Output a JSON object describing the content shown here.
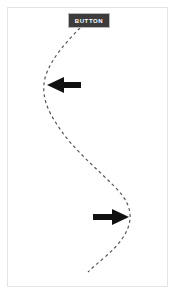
{
  "canvas": {
    "width": 176,
    "height": 295,
    "background_color": "#ffffff"
  },
  "frame": {
    "name": "page-border",
    "border_color": "#e3e3e3",
    "x": 7,
    "y": 7,
    "width": 161,
    "height": 280
  },
  "button": {
    "label": "BUTTON",
    "text_color": "#ffffff",
    "fill_color": "#3c3c3c",
    "border_color": "#b9b9b9",
    "x": 68,
    "y": 13,
    "width": 42,
    "height": 15
  },
  "curve": {
    "name": "dashed-swoosh-path",
    "color": "#555555",
    "stroke_width": 1.2,
    "dash_pattern": "3 3",
    "style": "dashed",
    "points": [
      [
        80,
        28
      ],
      [
        58,
        52
      ],
      [
        45,
        76
      ],
      [
        44,
        96
      ],
      [
        56,
        124
      ],
      [
        80,
        152
      ],
      [
        108,
        180
      ],
      [
        125,
        200
      ],
      [
        130,
        218
      ],
      [
        126,
        234
      ],
      [
        112,
        250
      ],
      [
        88,
        272
      ]
    ]
  },
  "arrows": [
    {
      "name": "arrow-left",
      "direction": "left",
      "color": "#111111",
      "tip_x": 47,
      "tip_y": 85,
      "tail_x": 81,
      "tail_y": 85,
      "length": 34,
      "head_width": 15,
      "shaft_height": 6
    },
    {
      "name": "arrow-right",
      "direction": "right",
      "color": "#111111",
      "tip_x": 129,
      "tip_y": 217,
      "tail_x": 93,
      "tail_y": 217,
      "length": 36,
      "head_width": 15,
      "shaft_height": 6
    }
  ]
}
